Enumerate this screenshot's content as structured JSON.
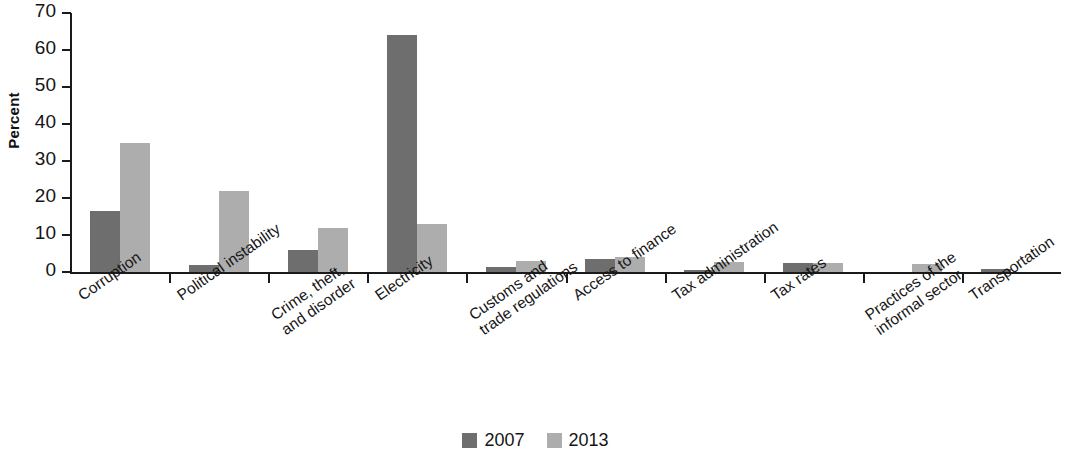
{
  "chart_data": {
    "type": "bar",
    "title": "",
    "xlabel": "",
    "ylabel": "Percent",
    "ylim": [
      0,
      70
    ],
    "yticks": [
      0,
      10,
      20,
      30,
      40,
      50,
      60,
      70
    ],
    "grid": false,
    "legend_position": "bottom-center",
    "categories": [
      "Corruption",
      "Political instability",
      "Crime, theft,\nand disorder",
      "Electricity",
      "Customs and\ntrade regulations",
      "Access to finance",
      "Tax administration",
      "Tax rates",
      "Practices of the\ninformal sector",
      "Transportation"
    ],
    "category_lines": [
      [
        "Corruption"
      ],
      [
        "Political instability"
      ],
      [
        "Crime, theft,",
        "and disorder"
      ],
      [
        "Electricity"
      ],
      [
        "Customs and",
        "trade regulations"
      ],
      [
        "Access to finance"
      ],
      [
        "Tax administration"
      ],
      [
        "Tax rates"
      ],
      [
        "Practices of the",
        "informal sector"
      ],
      [
        "Transportation"
      ]
    ],
    "series": [
      {
        "name": "2007",
        "color": "#6e6e6e",
        "values": [
          16.5,
          1.8,
          6.0,
          64.0,
          1.4,
          3.4,
          0.6,
          2.5,
          0.0,
          0.7
        ]
      },
      {
        "name": "2013",
        "color": "#adadad",
        "values": [
          35.0,
          21.8,
          11.9,
          13.0,
          3.0,
          4.0,
          2.6,
          2.4,
          2.1,
          0.0
        ]
      }
    ]
  },
  "legend": {
    "items": [
      {
        "label": "2007",
        "color": "#6e6e6e"
      },
      {
        "label": "2013",
        "color": "#adadad"
      }
    ]
  },
  "axis": {
    "y_title": "Percent"
  }
}
